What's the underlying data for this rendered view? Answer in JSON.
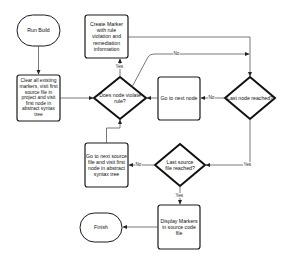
{
  "diagram": {
    "type": "flowchart",
    "nodes": {
      "run_build": {
        "label": "Run Build",
        "shape": "terminal"
      },
      "create_marker": {
        "label": "Create Marker with rule violation and remediation information",
        "shape": "process"
      },
      "clear_markers": {
        "label": "Clear all existing markers, visit first source file in project and visit first node in abstract syntax tree",
        "shape": "process"
      },
      "violate_rule": {
        "label": "Does node violate rule?",
        "shape": "decision"
      },
      "next_node": {
        "label": "Go to next node",
        "shape": "process"
      },
      "last_node": {
        "label": "Last node reached?",
        "shape": "decision"
      },
      "next_source": {
        "label": "Go to next source file and visit first node in abstract syntax tree",
        "shape": "process"
      },
      "last_source": {
        "label": "Last source file reached?",
        "shape": "decision"
      },
      "display_markers": {
        "label": "Display Markers in source code file",
        "shape": "process"
      },
      "finish": {
        "label": "Finish",
        "shape": "terminal"
      }
    },
    "edges": {
      "violate_yes": "Yes",
      "violate_no": "No",
      "last_node_no": "No",
      "last_node_yes": "Yes",
      "last_source_no": "No",
      "last_source_yes": "Yes"
    },
    "colors": {
      "stroke": "#1a1a1a",
      "line": "#555555",
      "background": "#ffffff"
    }
  }
}
